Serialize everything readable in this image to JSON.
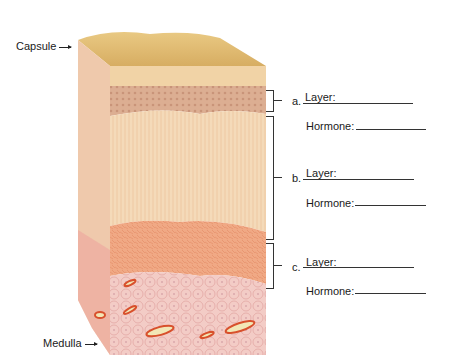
{
  "diagram": {
    "labels": {
      "capsule": "Capsule",
      "medulla": "Medulla"
    },
    "zones": [
      {
        "letter": "a.",
        "layer_label": "Layer:",
        "hormone_label": "Hormone:",
        "layer_value": "",
        "hormone_value": ""
      },
      {
        "letter": "b.",
        "layer_label": "Layer:",
        "hormone_label": "Hormone:",
        "layer_value": "",
        "hormone_value": ""
      },
      {
        "letter": "c.",
        "layer_label": "Layer:",
        "hormone_label": "Hormone:",
        "layer_value": "",
        "hormone_value": ""
      }
    ],
    "colors": {
      "capsule_top": "#e6c07a",
      "capsule_band": "#f1d3a6",
      "zona_glomerulosa": "#d9a88a",
      "zona_fasciculata": "#f4d9b8",
      "zona_reticularis": "#eea27f",
      "medulla": "#f0c2bd",
      "vessel": "#d8502c",
      "vessel_lumen": "#f2e7b6"
    }
  }
}
